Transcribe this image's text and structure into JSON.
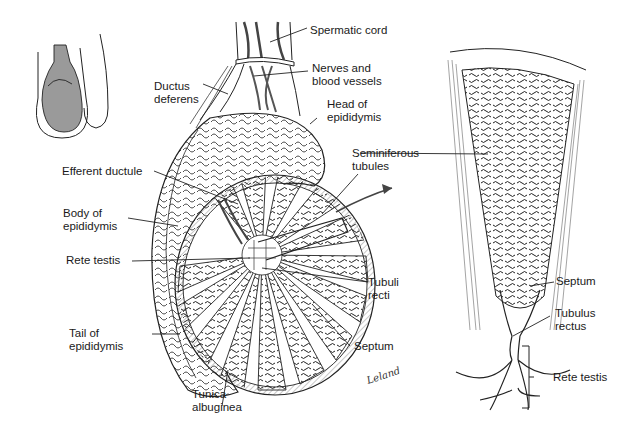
{
  "diagram": {
    "signature": "Leland",
    "labels": {
      "spermatic_cord": "Spermatic cord",
      "nerves_and_blood_vessels": "Nerves and\nblood vessels",
      "ductus_deferens": "Ductus\ndeferens",
      "head_of_epididymis": "Head of\nepididymis",
      "efferent_ductule": "Efferent ductule",
      "seminiferous_tubules": "Seminiferous\ntubules",
      "body_of_epididymis": "Body of\nepididymis",
      "rete_testis": "Rete testis",
      "tubuli_recti": "Tubuli\nrecti",
      "tail_of_epididymis": "Tail of\nepididymis",
      "septum_left": "Septum",
      "tunica_albuginea": "Tunica\nalbuginea",
      "septum_right": "Septum",
      "tubulus_rectus": "Tubulus\nrectus",
      "rete_testis_right": "Rete testis"
    },
    "colors": {
      "line": "#1a1a1a",
      "testis_fill_inset": "#9a9a9a",
      "background": "#ffffff"
    }
  }
}
